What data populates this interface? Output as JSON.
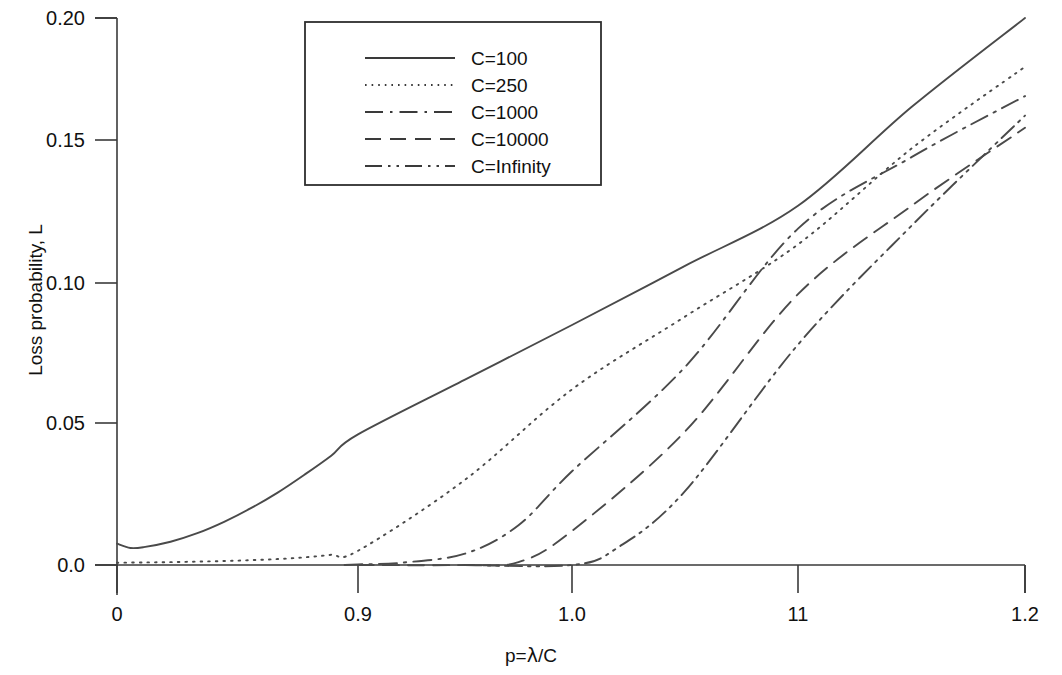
{
  "chart_data": {
    "type": "line",
    "title": "",
    "xlabel": "p=λ/C",
    "ylabel": "Loss probability, L",
    "xlim": [
      0,
      1.2
    ],
    "ylim": [
      0,
      0.2
    ],
    "grid": false,
    "legend_position": "top-center",
    "x_tick_labels": [
      "0",
      "0.9",
      "1.0",
      "11",
      "1.2"
    ],
    "x_tick_values": [
      0,
      0.9,
      1.0,
      1.1,
      1.2
    ],
    "y_tick_labels": [
      "0.0",
      "0.05",
      "0.10",
      "0.15",
      "0.20"
    ],
    "y_tick_values": [
      0.0,
      0.05,
      0.1,
      0.15,
      0.2
    ],
    "series": [
      {
        "name": "C=100",
        "style": "solid",
        "x": [
          0.0,
          0.05,
          0.1,
          0.2,
          0.3,
          0.4,
          0.5,
          0.6,
          0.7,
          0.8,
          0.9,
          0.95,
          1.0,
          1.05,
          1.1,
          1.15,
          1.2
        ],
        "values": [
          0.0075,
          0.006,
          0.0063,
          0.0082,
          0.0112,
          0.0152,
          0.02,
          0.0255,
          0.0318,
          0.0385,
          0.046,
          0.0655,
          0.085,
          0.106,
          0.127,
          0.1635,
          0.2
        ]
      },
      {
        "name": "C=250",
        "style": "dotted",
        "x": [
          0.0,
          0.1,
          0.2,
          0.3,
          0.4,
          0.5,
          0.6,
          0.7,
          0.8,
          0.9,
          0.95,
          1.0,
          1.05,
          1.1,
          1.15,
          1.2
        ],
        "values": [
          0.0008,
          0.0009,
          0.001,
          0.0012,
          0.0014,
          0.0017,
          0.0021,
          0.0027,
          0.0036,
          0.005,
          0.03,
          0.062,
          0.088,
          0.1135,
          0.147,
          0.18
        ]
      },
      {
        "name": "C=1000",
        "style": "dashdot",
        "x": [
          0.85,
          0.9,
          0.92,
          0.95,
          0.975,
          1.0,
          1.05,
          1.1,
          1.15,
          1.2
        ],
        "values": [
          0.0,
          0.0002,
          0.0008,
          0.004,
          0.014,
          0.033,
          0.07,
          0.119,
          0.144,
          0.168
        ]
      },
      {
        "name": "C=10000",
        "style": "dashed",
        "x": [
          0.9,
          0.95,
          0.975,
          1.0,
          1.05,
          1.1,
          1.15,
          1.2
        ],
        "values": [
          0.0,
          0.0,
          0.001,
          0.012,
          0.047,
          0.096,
          0.127,
          0.155
        ]
      },
      {
        "name": "C=Infinity",
        "style": "dashdotdot",
        "x": [
          0.95,
          1.0,
          1.02,
          1.05,
          1.1,
          1.15,
          1.2
        ],
        "values": [
          0.0,
          0.0,
          0.006,
          0.026,
          0.078,
          0.12,
          0.16
        ]
      }
    ],
    "legend": [
      {
        "label": "C=100",
        "style": "solid"
      },
      {
        "label": "C=250",
        "style": "dotted"
      },
      {
        "label": "C=1000",
        "style": "dashdot"
      },
      {
        "label": "C=10000",
        "style": "dashed"
      },
      {
        "label": "C=Infinity",
        "style": "dashdotdot"
      }
    ]
  }
}
